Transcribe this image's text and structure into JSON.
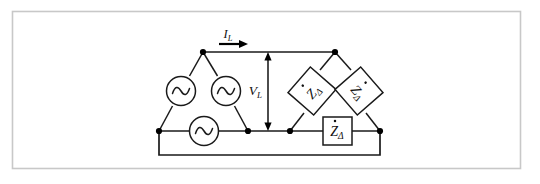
{
  "figure": {
    "frame": {
      "border_color": "#c8c8c8",
      "background": "#ffffff"
    },
    "colors": {
      "wire": "#1a1a1a",
      "node": "#000000",
      "text": "#111111",
      "component_fill": "#ffffff",
      "frame": "#c8c8c8"
    },
    "labels": {
      "line_current": {
        "symbol": "I",
        "subscript": "L",
        "full": "I_L",
        "description": "line-current-arrow-label"
      },
      "line_voltage": {
        "symbol": "V",
        "subscript": "L",
        "full": "V_L",
        "description": "line-voltage-double-arrow-label"
      },
      "impedance": {
        "symbol": "Z",
        "subscript": "Δ",
        "overdot": true,
        "full": "Ż_Δ",
        "description": "delta-load-impedance"
      }
    },
    "source": {
      "name": "delta-connected-ac-source",
      "connection": "delta",
      "symbol": "sine-wave",
      "count": 3,
      "elements": [
        {
          "id": "source-left",
          "label": "ac-source-left"
        },
        {
          "id": "source-right",
          "label": "ac-source-right"
        },
        {
          "id": "source-bottom",
          "label": "ac-source-bottom"
        }
      ]
    },
    "load": {
      "name": "delta-connected-load",
      "connection": "delta",
      "count": 3,
      "elements": [
        {
          "id": "impedance-left",
          "label": "impedance-left-branch",
          "orientation": "tilted-left"
        },
        {
          "id": "impedance-right",
          "label": "impedance-right-branch",
          "orientation": "tilted-right"
        },
        {
          "id": "impedance-bottom",
          "label": "impedance-bottom-branch",
          "orientation": "horizontal"
        }
      ]
    },
    "nodes": [
      {
        "id": "src-top",
        "x": 203,
        "y": 52
      },
      {
        "id": "src-left",
        "x": 159,
        "y": 131
      },
      {
        "id": "src-right",
        "x": 248,
        "y": 131
      },
      {
        "id": "load-top",
        "x": 335,
        "y": 52
      },
      {
        "id": "load-left",
        "x": 290,
        "y": 131
      },
      {
        "id": "load-right",
        "x": 380,
        "y": 131
      }
    ]
  }
}
